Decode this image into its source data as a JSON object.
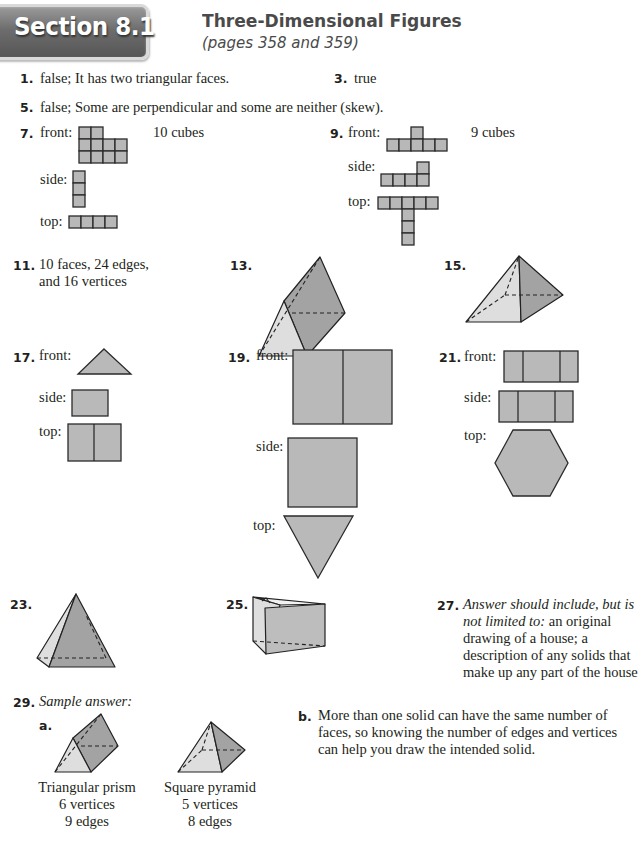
{
  "header": {
    "section_label": "Section 8.1",
    "title": "Three-Dimensional Figures",
    "subtitle": "(pages 358 and 359)"
  },
  "answers": {
    "a1": {
      "number": "1.",
      "text": "false; It has two triangular faces."
    },
    "a3": {
      "number": "3.",
      "text": "true"
    },
    "a5": {
      "number": "5.",
      "text": "false; Some are perpendicular and some are neither (skew)."
    },
    "a7": {
      "number": "7.",
      "front_label": "front:",
      "side_label": "side:",
      "top_label": "top:",
      "count": "10 cubes"
    },
    "a9": {
      "number": "9.",
      "front_label": "front:",
      "side_label": "side:",
      "top_label": "top:",
      "count": "9 cubes"
    },
    "a11": {
      "number": "11.",
      "line1": "10 faces, 24 edges,",
      "line2": "and 16 vertices"
    },
    "a13": {
      "number": "13.",
      "figure": "triangular-prism"
    },
    "a15": {
      "number": "15.",
      "figure": "square-pyramid"
    },
    "a17": {
      "number": "17.",
      "front_label": "front:",
      "side_label": "side:",
      "top_label": "top:"
    },
    "a19": {
      "number": "19.",
      "front_label": "front:",
      "side_label": "side:",
      "top_label": "top:"
    },
    "a21": {
      "number": "21.",
      "front_label": "front:",
      "side_label": "side:",
      "top_label": "top:"
    },
    "a23": {
      "number": "23.",
      "figure": "triangular-pyramid"
    },
    "a25": {
      "number": "25.",
      "figure": "right-triangular-prism"
    },
    "a27": {
      "number": "27.",
      "italic_lead_1": "Answer should include, but is",
      "italic_lead_2": "not limited to:",
      "line2_rest": " an original",
      "line3": "drawing of a house; a",
      "line4": "description of any solids that",
      "line5": "make up any part of the house"
    },
    "a29": {
      "number": "29.",
      "intro": "Sample answer:",
      "part_a_label": "a.",
      "solid1": {
        "name": "Triangular prism",
        "vertices": "6 vertices",
        "edges": "9 edges"
      },
      "solid2": {
        "name": "Square pyramid",
        "vertices": "5 vertices",
        "edges": "8 edges"
      },
      "part_b_label": "b.",
      "part_b_line1": "More than one solid can have the same number of",
      "part_b_line2": "faces, so knowing the number of edges and vertices",
      "part_b_line3": "can help you draw the intended solid."
    }
  },
  "colors": {
    "badge_gray": "#6d6d6d",
    "title_gray": "#4a4a4a",
    "shape_fill": "#b9b9b9",
    "text": "#231f20"
  }
}
